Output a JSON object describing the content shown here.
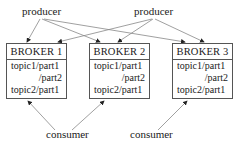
{
  "producers": [
    {
      "label": "producer"
    },
    {
      "label": "producer"
    }
  ],
  "consumers": [
    {
      "label": "consumer"
    },
    {
      "label": "consumer"
    }
  ],
  "brokers": [
    {
      "title": "BROKER 1",
      "partitions": [
        "topic1/part1",
        "/part2",
        "topic2/part1"
      ]
    },
    {
      "title": "BROKER 2",
      "partitions": [
        "topic1/part1",
        "/part2",
        "topic2/part1"
      ]
    },
    {
      "title": "BROKER 3",
      "partitions": [
        "topic1/part1",
        "/part2",
        "topic2/part1"
      ]
    }
  ],
  "colors": {
    "line": "#777777",
    "border": "#555555",
    "text": "#1a1a1a"
  }
}
